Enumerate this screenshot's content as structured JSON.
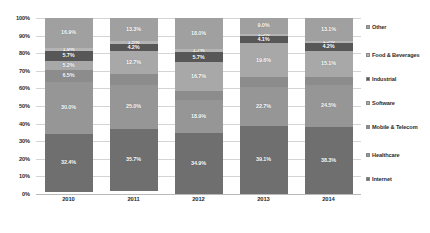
{
  "chart_data": {
    "type": "bar",
    "subtype": "stacked-100-percent",
    "title": "",
    "xlabel": "",
    "ylabel": "",
    "ylim": [
      0,
      100
    ],
    "grid": true,
    "legend_position": "right",
    "categories": [
      "2010",
      "2011",
      "2012",
      "2013",
      "2014"
    ],
    "ytick_labels": [
      "0%",
      "10%",
      "20%",
      "30%",
      "40%",
      "50%",
      "60%",
      "70%",
      "80%",
      "90%",
      "100%"
    ],
    "ytick_values": [
      0,
      10,
      20,
      30,
      40,
      50,
      60,
      70,
      80,
      90,
      100
    ],
    "stack_order_bottom_to_top": [
      "Internet",
      "Healthcare",
      "Mobile & Telecom",
      "Software",
      "Industrial",
      "Food & Beverages",
      "Other"
    ],
    "series": [
      {
        "name": "Internet",
        "color": "#6f6f6f",
        "values": [
          32.4,
          35.7,
          34.9,
          39.1,
          38.3
        ],
        "labels": [
          "32.4%",
          "35.7%",
          "34.9%",
          "39.1%",
          "38.3%"
        ]
      },
      {
        "name": "Healthcare",
        "color": "#969696",
        "values": [
          30.0,
          25.0,
          18.9,
          22.7,
          24.5
        ],
        "labels": [
          "30.0%",
          "25.0%",
          "18.9%",
          "22.7%",
          "24.5%"
        ]
      },
      {
        "name": "Mobile & Telecom",
        "color": "#8c8c8c",
        "values": [
          6.5,
          6.1,
          5.1,
          5.4,
          4.6
        ],
        "labels": [
          "6.5%",
          "",
          "",
          "",
          ""
        ]
      },
      {
        "name": "Software",
        "color": "#a8a8a8",
        "values": [
          5.2,
          12.7,
          16.7,
          19.6,
          15.1
        ],
        "labels": [
          "5.2%",
          "12.7%",
          "16.7%",
          "19.6%",
          "15.1%"
        ]
      },
      {
        "name": "Industrial",
        "color": "#575757",
        "values": [
          5.7,
          4.2,
          5.7,
          4.1,
          4.2
        ],
        "labels": [
          "5.7%",
          "4.2%",
          "5.7%",
          "4.1%",
          "4.2%"
        ]
      },
      {
        "name": "Food & Beverages",
        "color": "#b4b4b4",
        "values": [
          1.9,
          1.5,
          1.7,
          1.5,
          1.5
        ],
        "labels": [
          "1.9%",
          "1.5%",
          "1.7%",
          "1.5%",
          "1.5%"
        ]
      },
      {
        "name": "Other",
        "color": "#a0a0a0",
        "values": [
          16.9,
          13.3,
          18.0,
          9.0,
          13.1
        ],
        "labels": [
          "16.9%",
          "13.3%",
          "18.0%",
          "9.0%",
          "13.1%"
        ]
      }
    ]
  },
  "legend": {
    "items": [
      {
        "label": "Other",
        "color": "#a0a0a0"
      },
      {
        "label": "Food & Beverages",
        "color": "#b4b4b4"
      },
      {
        "label": "Industrial",
        "color": "#575757"
      },
      {
        "label": "Software",
        "color": "#a8a8a8"
      },
      {
        "label": "Mobile & Telecom",
        "color": "#8c8c8c"
      },
      {
        "label": "Healthcare",
        "color": "#969696"
      },
      {
        "label": "Internet",
        "color": "#6f6f6f"
      }
    ]
  }
}
